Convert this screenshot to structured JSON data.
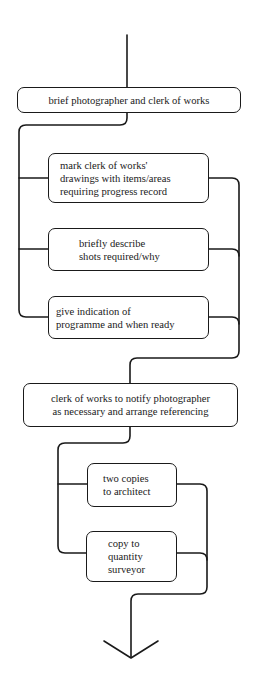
{
  "diagram": {
    "type": "process-flowchart",
    "line_color": "#1a1a1a",
    "background": "#ffffff",
    "steps": [
      {
        "id": "brief",
        "lines": [
          "brief photographer and clerk of works"
        ]
      },
      {
        "id": "mark-drawings",
        "lines": [
          "mark clerk of works'",
          "drawings with items/areas",
          "requiring progress record"
        ]
      },
      {
        "id": "describe-shots",
        "lines": [
          "briefly describe",
          "shots required/why"
        ]
      },
      {
        "id": "programme",
        "lines": [
          "give indication of",
          "programme and when ready"
        ]
      },
      {
        "id": "notify",
        "lines": [
          "clerk of works to notify photographer",
          "as necessary and arrange referencing"
        ]
      },
      {
        "id": "copies-architect",
        "lines": [
          "two copies",
          "to architect"
        ]
      },
      {
        "id": "copy-qs",
        "lines": [
          "copy to",
          "quantity",
          "surveyor"
        ]
      }
    ],
    "groups": [
      {
        "name": "parallel-briefing-tasks",
        "members": [
          "mark-drawings",
          "describe-shots",
          "programme"
        ]
      },
      {
        "name": "parallel-distribution",
        "members": [
          "copies-architect",
          "copy-qs"
        ]
      }
    ],
    "end": {
      "icon": "down-arrow-icon"
    }
  }
}
